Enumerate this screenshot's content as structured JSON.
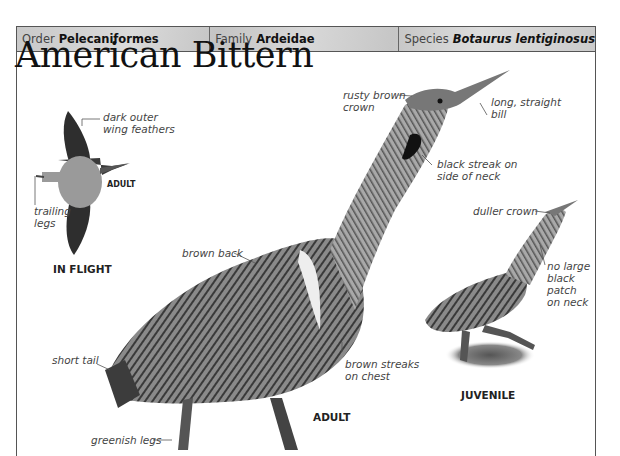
{
  "header": {
    "order": {
      "key": "Order",
      "value": "Pelecaniformes"
    },
    "family": {
      "key": "Family",
      "value": "Ardeidae"
    },
    "species": {
      "key": "Species",
      "value": "Botaurus lentiginosus"
    }
  },
  "title": "American Bittern",
  "flight_inset": {
    "caption": "IN FLIGHT",
    "age_label": "ADULT",
    "annotations": {
      "wing": "dark outer\nwing feathers",
      "wing_line1": "dark outer",
      "wing_line2": "wing feathers",
      "legs_line1": "trailing",
      "legs_line2": "legs"
    }
  },
  "adult": {
    "caption": "ADULT",
    "annotations": {
      "crown_line1": "rusty brown",
      "crown_line2": "crown",
      "bill_line1": "long, straight",
      "bill_line2": "bill",
      "neck_line1": "black streak on",
      "neck_line2": "side of neck",
      "back": "brown back",
      "tail": "short tail",
      "chest_line1": "brown streaks",
      "chest_line2": "on chest",
      "legs": "greenish legs"
    }
  },
  "juvenile": {
    "caption": "JUVENILE",
    "annotations": {
      "crown": "duller crown",
      "neck_line1": "no large",
      "neck_line2": "black",
      "neck_line3": "patch",
      "neck_line4": "on neck"
    }
  },
  "colors": {
    "header_bg": "#cfcfcf",
    "frame_border": "#555555",
    "text": "#222222",
    "annotation_text": "#444444"
  }
}
